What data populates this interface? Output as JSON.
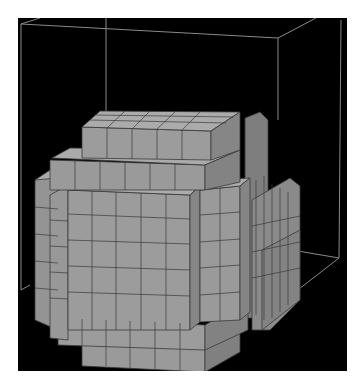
{
  "scene": {
    "type": "3d-voxel-render",
    "subject": "voxelized sphere",
    "background_color": "#000000",
    "page_background": "#ffffff",
    "voxel_color": "#9a9a9a",
    "voxel_top_color": "#a8a8a8",
    "voxel_side_color": "#7c7c7c",
    "voxel_edge_color": "#3a3a3a",
    "bounding_box_color": "#8a8a8a"
  }
}
